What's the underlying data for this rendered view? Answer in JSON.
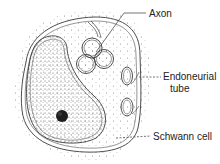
{
  "diagram": {
    "labels": {
      "axon": "Axon",
      "endoneurial_line1": "Endoneurial",
      "endoneurial_line2": "tube",
      "schwann": "Schwann cell"
    },
    "structures": [
      "outer-halo",
      "schwann-cell-membrane",
      "nucleus",
      "nucleolus",
      "axon-cluster",
      "endoneurial-tube-upper",
      "endoneurial-tube-lower"
    ],
    "colors": {
      "ink": "#3a3a3a",
      "stipple": "#6a6a6a",
      "nucleolus": "#1e1e1e",
      "background": "#ffffff"
    }
  }
}
